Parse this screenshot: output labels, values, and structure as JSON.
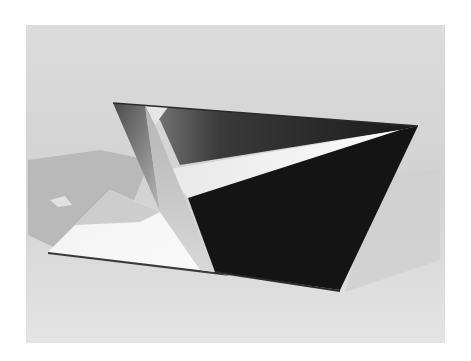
{
  "image": {
    "subject": "folded metal sculpture photograph",
    "style": "black-and-white",
    "colors": {
      "page_border": "#ffffff",
      "background_top": "#d9d9d9",
      "background_bottom": "#e6e6e6",
      "shadow": "#bdbdbd",
      "dark_face": "#141414",
      "white_base": "#f5f5f5",
      "mid_gray": "#a8a8a8"
    }
  }
}
